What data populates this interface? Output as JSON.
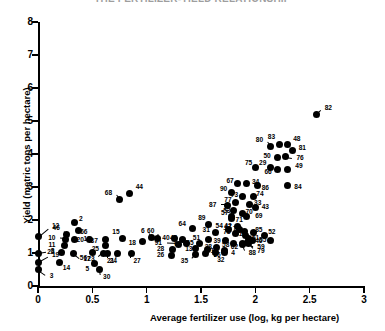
{
  "chart_data": {
    "type": "scatter",
    "title": "THE FERTILIZER-YIELD RELATIONSHIP",
    "xlabel": "Average fertilizer use (log, kg per hectare)",
    "ylabel": "Yield (metric tons per hectare)",
    "xlim": [
      0,
      3
    ],
    "ylim": [
      0,
      8
    ],
    "xticks": [
      0,
      0.5,
      1,
      1.5,
      2,
      2.5,
      3
    ],
    "xticklabels": [
      "0",
      "0.5",
      "1",
      "1.5",
      "2",
      "2.5",
      "3"
    ],
    "yticks": [
      0,
      1,
      2,
      3,
      4,
      5,
      6,
      7,
      8
    ],
    "yticklabels": [
      "0",
      "1",
      "2",
      "3",
      "4",
      "5",
      "6",
      "7",
      "8"
    ],
    "grid": false,
    "legend": null,
    "point_label_field": "label",
    "points": [
      {
        "label": "3",
        "x": 0.0,
        "y": 0.5,
        "lx": 0.09,
        "ly": 0.3
      },
      {
        "label": "19",
        "x": 0.0,
        "y": 0.72,
        "lx": 0.11,
        "ly": 0.92
      },
      {
        "label": "8",
        "x": 0.0,
        "y": 1.0,
        "lx": 0.1,
        "ly": 1.05
      },
      {
        "label": "12",
        "x": 0.0,
        "y": 1.5,
        "lx": 0.11,
        "ly": 1.8
      },
      {
        "label": "14",
        "x": 0.2,
        "y": 0.72,
        "lx": 0.21,
        "ly": 0.55
      },
      {
        "label": "22",
        "x": 0.22,
        "y": 1.02,
        "lx": 0.17,
        "ly": 1.02
      },
      {
        "label": "11",
        "x": 0.24,
        "y": 1.22,
        "lx": 0.18,
        "ly": 1.24
      },
      {
        "label": "10",
        "x": 0.25,
        "y": 1.42,
        "lx": 0.18,
        "ly": 1.44
      },
      {
        "label": "46",
        "x": 0.26,
        "y": 1.56,
        "lx": 0.22,
        "ly": 1.74
      },
      {
        "label": "16",
        "x": 0.34,
        "y": 1.4,
        "lx": 0.4,
        "ly": 1.42
      },
      {
        "label": "17",
        "x": 0.33,
        "y": 0.98,
        "lx": 0.4,
        "ly": 0.8
      },
      {
        "label": "5",
        "x": 0.52,
        "y": 0.68,
        "lx": 0.49,
        "ly": 0.52
      },
      {
        "label": "30",
        "x": 0.57,
        "y": 0.5,
        "lx": 0.58,
        "ly": 0.26
      },
      {
        "label": "56",
        "x": 0.5,
        "y": 1.02,
        "lx": 0.47,
        "ly": 0.84
      },
      {
        "label": "23",
        "x": 0.6,
        "y": 1.0,
        "lx": 0.54,
        "ly": 0.82
      },
      {
        "label": "25",
        "x": 0.62,
        "y": 1.22,
        "lx": 0.58,
        "ly": 1.12
      },
      {
        "label": "37",
        "x": 0.62,
        "y": 1.42,
        "lx": 0.57,
        "ly": 1.36
      },
      {
        "label": "20",
        "x": 0.47,
        "y": 1.4,
        "lx": 0.44,
        "ly": 1.38
      },
      {
        "label": "66",
        "x": 0.37,
        "y": 1.68,
        "lx": 0.37,
        "ly": 1.62
      },
      {
        "label": "2",
        "x": 0.34,
        "y": 1.92,
        "lx": 0.36,
        "ly": 2.02
      },
      {
        "label": "68",
        "x": 0.75,
        "y": 2.62,
        "lx": 0.7,
        "ly": 2.82
      },
      {
        "label": "44",
        "x": 0.84,
        "y": 2.8,
        "lx": 0.88,
        "ly": 2.98
      },
      {
        "label": "21",
        "x": 0.73,
        "y": 1.0,
        "lx": 0.72,
        "ly": 0.76
      },
      {
        "label": "24",
        "x": 0.64,
        "y": 1.0,
        "lx": 0.64,
        "ly": 0.76
      },
      {
        "label": "27",
        "x": 0.86,
        "y": 1.0,
        "lx": 0.86,
        "ly": 0.76
      },
      {
        "label": "15",
        "x": 0.78,
        "y": 1.44,
        "lx": 0.77,
        "ly": 1.62
      },
      {
        "label": "18",
        "x": 0.96,
        "y": 1.34,
        "lx": 0.92,
        "ly": 1.3
      },
      {
        "label": "6",
        "x": 1.04,
        "y": 1.48,
        "lx": 1.0,
        "ly": 1.66
      },
      {
        "label": "60",
        "x": 1.1,
        "y": 1.44,
        "lx": 1.09,
        "ly": 1.66
      },
      {
        "label": "35",
        "x": 1.45,
        "y": 0.96,
        "lx": 1.4,
        "ly": 0.76
      },
      {
        "label": "7",
        "x": 1.54,
        "y": 1.0,
        "lx": 1.58,
        "ly": 1.0
      },
      {
        "label": "32",
        "x": 1.63,
        "y": 1.02,
        "lx": 1.63,
        "ly": 0.78
      },
      {
        "label": "26",
        "x": 1.23,
        "y": 0.92,
        "lx": 1.18,
        "ly": 0.92
      },
      {
        "label": "28",
        "x": 1.24,
        "y": 1.1,
        "lx": 1.18,
        "ly": 1.1
      },
      {
        "label": "91",
        "x": 1.29,
        "y": 1.26,
        "lx": 1.16,
        "ly": 1.28
      },
      {
        "label": "63",
        "x": 1.37,
        "y": 1.28,
        "lx": 1.34,
        "ly": 1.26
      },
      {
        "label": "45",
        "x": 1.33,
        "y": 1.42,
        "lx": 1.3,
        "ly": 1.44
      },
      {
        "label": "40",
        "x": 1.26,
        "y": 1.44,
        "lx": 1.23,
        "ly": 1.46
      },
      {
        "label": "13",
        "x": 1.45,
        "y": 1.14,
        "lx": 1.44,
        "ly": 1.1
      },
      {
        "label": "65",
        "x": 1.49,
        "y": 1.3,
        "lx": 1.45,
        "ly": 1.28
      },
      {
        "label": "51",
        "x": 1.57,
        "y": 1.42,
        "lx": 1.51,
        "ly": 1.44
      },
      {
        "label": "31",
        "x": 1.63,
        "y": 1.62,
        "lx": 1.6,
        "ly": 1.7
      },
      {
        "label": "64",
        "x": 1.42,
        "y": 1.74,
        "lx": 1.38,
        "ly": 1.88
      },
      {
        "label": "89",
        "x": 1.57,
        "y": 1.86,
        "lx": 1.56,
        "ly": 2.04
      },
      {
        "label": "1",
        "x": 1.56,
        "y": 1.1,
        "lx": 1.57,
        "ly": 1.06
      },
      {
        "label": "38",
        "x": 1.64,
        "y": 1.18,
        "lx": 1.62,
        "ly": 1.16
      },
      {
        "label": "36",
        "x": 1.72,
        "y": 1.02,
        "lx": 1.7,
        "ly": 0.94
      },
      {
        "label": "4",
        "x": 1.72,
        "y": 1.08,
        "lx": 1.76,
        "ly": 0.98
      },
      {
        "label": "54",
        "x": 1.75,
        "y": 1.7,
        "lx": 1.72,
        "ly": 1.82
      },
      {
        "label": "39",
        "x": 1.73,
        "y": 1.38,
        "lx": 1.7,
        "ly": 1.36
      },
      {
        "label": "78",
        "x": 1.82,
        "y": 1.58,
        "lx": 1.79,
        "ly": 1.64
      },
      {
        "label": "42",
        "x": 1.85,
        "y": 1.72,
        "lx": 1.8,
        "ly": 1.82
      },
      {
        "label": "57",
        "x": 1.78,
        "y": 2.04,
        "lx": 1.77,
        "ly": 2.2
      },
      {
        "label": "58",
        "x": 1.8,
        "y": 1.3,
        "lx": 1.78,
        "ly": 1.22
      },
      {
        "label": "62",
        "x": 1.88,
        "y": 1.26,
        "lx": 1.86,
        "ly": 1.16
      },
      {
        "label": "59",
        "x": 1.94,
        "y": 1.28,
        "lx": 2.0,
        "ly": 1.16
      },
      {
        "label": "79",
        "x": 1.93,
        "y": 1.32,
        "lx": 2.0,
        "ly": 1.06
      },
      {
        "label": "88",
        "x": 1.88,
        "y": 1.3,
        "lx": 1.92,
        "ly": 0.98
      },
      {
        "label": "41",
        "x": 1.91,
        "y": 1.52,
        "lx": 1.9,
        "ly": 1.56
      },
      {
        "label": "61",
        "x": 1.94,
        "y": 1.44,
        "lx": 1.95,
        "ly": 1.44
      },
      {
        "label": "46b",
        "x": 1.97,
        "y": 1.38,
        "lx": 1.98,
        "ly": 1.36
      },
      {
        "label": "72",
        "x": 1.9,
        "y": 1.66,
        "lx": 1.88,
        "ly": 1.72
      },
      {
        "label": "47",
        "x": 1.84,
        "y": 1.8,
        "lx": 1.8,
        "ly": 1.78
      },
      {
        "label": "85",
        "x": 1.98,
        "y": 1.62,
        "lx": 1.98,
        "ly": 1.68
      },
      {
        "label": "52",
        "x": 2.08,
        "y": 1.52,
        "lx": 2.1,
        "ly": 1.62
      },
      {
        "label": "55",
        "x": 2.14,
        "y": 1.38,
        "lx": 2.12,
        "ly": 1.38
      },
      {
        "label": "71",
        "x": 1.78,
        "y": 2.1,
        "lx": 1.8,
        "ly": 1.98
      },
      {
        "label": "53",
        "x": 1.8,
        "y": 2.28,
        "lx": 1.79,
        "ly": 2.26
      },
      {
        "label": "70",
        "x": 1.88,
        "y": 2.2,
        "lx": 1.89,
        "ly": 2.22
      },
      {
        "label": "69",
        "x": 1.92,
        "y": 2.12,
        "lx": 1.98,
        "ly": 2.12
      },
      {
        "label": "87",
        "x": 1.74,
        "y": 2.44,
        "lx": 1.66,
        "ly": 2.44
      },
      {
        "label": "77",
        "x": 1.82,
        "y": 2.52,
        "lx": 1.8,
        "ly": 2.6
      },
      {
        "label": "33",
        "x": 1.95,
        "y": 2.46,
        "lx": 1.97,
        "ly": 2.52
      },
      {
        "label": "43",
        "x": 2.0,
        "y": 2.38,
        "lx": 2.04,
        "ly": 2.4
      },
      {
        "label": "73",
        "x": 1.88,
        "y": 2.72,
        "lx": 1.86,
        "ly": 2.76
      },
      {
        "label": "74",
        "x": 1.98,
        "y": 2.7,
        "lx": 1.99,
        "ly": 2.78
      },
      {
        "label": "90",
        "x": 1.78,
        "y": 2.84,
        "lx": 1.76,
        "ly": 2.92
      },
      {
        "label": "67",
        "x": 1.84,
        "y": 3.1,
        "lx": 1.82,
        "ly": 3.18
      },
      {
        "label": "34",
        "x": 1.92,
        "y": 3.12,
        "lx": 1.95,
        "ly": 3.14
      },
      {
        "label": "86",
        "x": 2.02,
        "y": 3.06,
        "lx": 2.04,
        "ly": 2.96
      },
      {
        "label": "84",
        "x": 2.3,
        "y": 3.04,
        "lx": 2.34,
        "ly": 3.0
      },
      {
        "label": "75",
        "x": 2.0,
        "y": 3.58,
        "lx": 1.99,
        "ly": 3.72
      },
      {
        "label": "29",
        "x": 2.14,
        "y": 3.6,
        "lx": 2.12,
        "ly": 3.72
      },
      {
        "label": "66b",
        "x": 2.2,
        "y": 3.52,
        "lx": 2.17,
        "ly": 3.46
      },
      {
        "label": "49",
        "x": 2.3,
        "y": 3.54,
        "lx": 2.35,
        "ly": 3.62
      },
      {
        "label": "50",
        "x": 2.2,
        "y": 3.9,
        "lx": 2.16,
        "ly": 3.92
      },
      {
        "label": "76",
        "x": 2.28,
        "y": 3.92,
        "lx": 2.36,
        "ly": 3.88
      },
      {
        "label": "80",
        "x": 2.14,
        "y": 4.22,
        "lx": 2.09,
        "ly": 4.42
      },
      {
        "label": "83",
        "x": 2.22,
        "y": 4.3,
        "lx": 2.2,
        "ly": 4.5
      },
      {
        "label": "48",
        "x": 2.3,
        "y": 4.3,
        "lx": 2.33,
        "ly": 4.44
      },
      {
        "label": "81",
        "x": 2.34,
        "y": 4.12,
        "lx": 2.38,
        "ly": 4.18
      },
      {
        "label": "82",
        "x": 2.56,
        "y": 5.2,
        "lx": 2.62,
        "ly": 5.38
      }
    ]
  }
}
